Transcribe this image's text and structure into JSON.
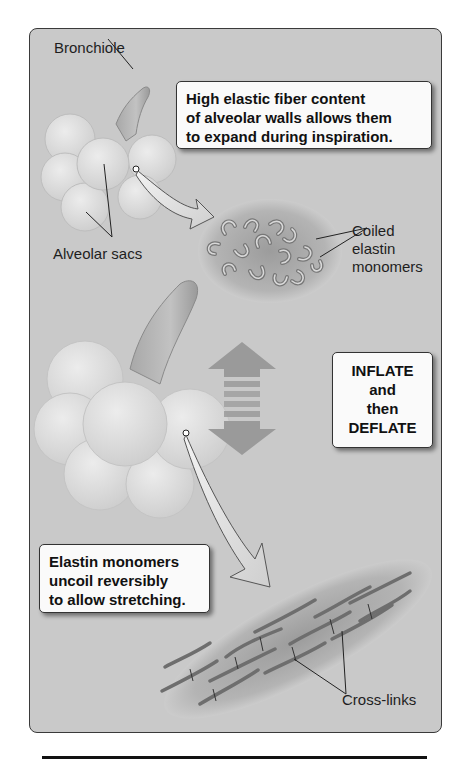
{
  "figure": {
    "labels": {
      "bronchiole": "Bronchiole",
      "alveolar_sacs": "Alveolar sacs",
      "coiled_elastin": [
        "Coiled",
        "elastin",
        "monomers"
      ],
      "cross_links": "Cross-links"
    },
    "callouts": {
      "top": [
        "High elastic fiber content",
        "of alveolar walls allows them",
        "to expand during inspiration."
      ],
      "middle": [
        "INFLATE",
        "and",
        "then",
        "DEFLATE"
      ],
      "bottom": [
        "Elastin monomers",
        "uncoil reversibly",
        "to allow stretching."
      ]
    },
    "colors": {
      "panel_background": "#c9c9c9",
      "panel_border": "#3a3a3a",
      "callout_background": "#fafafa",
      "alveoli_fill": "#dcdcdc",
      "fiber_stroke": "#6e6e6e",
      "double_arrow": "#9a9a9a"
    }
  }
}
